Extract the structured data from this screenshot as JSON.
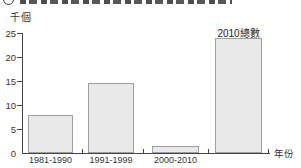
{
  "chart_data": {
    "type": "bar",
    "categories": [
      "1981-1990",
      "1991-1999",
      "2000-2010",
      "2010總數"
    ],
    "values": [
      8,
      14.5,
      1.5,
      24
    ],
    "category_label_placement": [
      "below-axis",
      "below-axis",
      "below-axis",
      "above-bar"
    ],
    "title": "",
    "xlabel": "年份",
    "ylabel": "千個",
    "ylim": [
      0,
      25
    ],
    "yticks": [
      0,
      5,
      10,
      15,
      20,
      25
    ],
    "grid": false,
    "legend": "none",
    "bar_fill_color": "#e9e9e9",
    "bar_border_color": "#9e9e9e",
    "axis_color": "#444444",
    "text_color": "#333333"
  }
}
